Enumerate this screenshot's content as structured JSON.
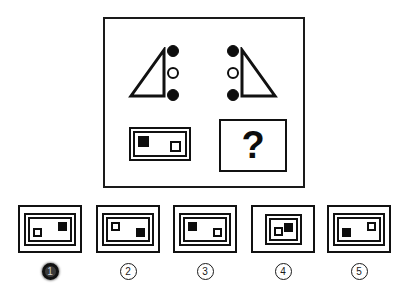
{
  "puzzle": {
    "type": "visual-analogy-matrix",
    "question_mark": "?",
    "colors": {
      "ink": "#111111",
      "fill_black": "#0d0d0d",
      "fill_white": "#ffffff",
      "selected_marker": "#3b3b3b"
    },
    "top_row": {
      "left_figure": {
        "name": "triangle-with-dots-left",
        "triangle_orientation": "right-angle-bottom-right",
        "dots_side": "right",
        "dots": [
          "filled",
          "hollow",
          "filled"
        ]
      },
      "right_figure": {
        "name": "triangle-with-dots-right",
        "triangle_orientation": "right-angle-bottom-left",
        "dots_side": "left",
        "dots": [
          "filled",
          "hollow",
          "filled"
        ]
      }
    },
    "bottom_row": {
      "reference_card": {
        "name": "reference-card",
        "border_style": "double",
        "shape": "wide",
        "squares": [
          {
            "fill": "black",
            "position": "top-left"
          },
          {
            "fill": "white",
            "position": "bottom-right"
          }
        ]
      },
      "answer_slot": {
        "name": "question-box",
        "border_style": "single",
        "content": "?"
      }
    }
  },
  "options": [
    {
      "id": "option-1",
      "label": "1",
      "selected": true,
      "border_style": "double",
      "shape": "wide",
      "squares": [
        {
          "fill": "black",
          "position": "top-right"
        },
        {
          "fill": "white",
          "position": "bottom-left"
        }
      ]
    },
    {
      "id": "option-2",
      "label": "2",
      "selected": false,
      "border_style": "double",
      "shape": "wide",
      "squares": [
        {
          "fill": "white",
          "position": "top-left"
        },
        {
          "fill": "black",
          "position": "bottom-right"
        }
      ]
    },
    {
      "id": "option-3",
      "label": "3",
      "selected": false,
      "border_style": "double",
      "shape": "wide",
      "squares": [
        {
          "fill": "black",
          "position": "top-left"
        },
        {
          "fill": "white",
          "position": "bottom-right"
        }
      ]
    },
    {
      "id": "option-4",
      "label": "4",
      "selected": false,
      "border_style": "double",
      "shape": "square",
      "squares": [
        {
          "fill": "black",
          "position": "top-right"
        },
        {
          "fill": "white",
          "position": "bottom-left"
        }
      ]
    },
    {
      "id": "option-5",
      "label": "5",
      "selected": false,
      "border_style": "double",
      "shape": "wide",
      "squares": [
        {
          "fill": "white",
          "position": "top-right"
        },
        {
          "fill": "black",
          "position": "bottom-left"
        }
      ]
    }
  ]
}
